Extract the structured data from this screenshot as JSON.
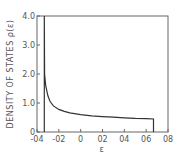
{
  "chart_data": {
    "type": "line",
    "title": "",
    "xlabel": "ε",
    "ylabel": "DENSITY OF STATES ρ(ε)",
    "xlim": [
      -0.4,
      0.8
    ],
    "ylim": [
      0,
      4.0
    ],
    "xticks": [
      "-0.4",
      "-0.2",
      "0",
      "0.2",
      "0.4",
      "0.6",
      "0.8"
    ],
    "xtick_labels": [
      "-04",
      "-02",
      "0",
      "02",
      "04",
      "06",
      "08"
    ],
    "yticks": [
      "0",
      "1.0",
      "2.0",
      "3.0",
      "4.0"
    ],
    "grid": false,
    "legend": null,
    "series": [
      {
        "name": "ρ(ε)",
        "x": [
          -0.333,
          -0.333,
          -0.33,
          -0.32,
          -0.3,
          -0.28,
          -0.25,
          -0.2,
          -0.15,
          -0.1,
          0.0,
          0.1,
          0.2,
          0.3,
          0.4,
          0.5,
          0.6,
          0.667,
          0.667
        ],
        "y": [
          0,
          4.0,
          2.0,
          1.6,
          1.25,
          1.05,
          0.9,
          0.78,
          0.71,
          0.66,
          0.6,
          0.56,
          0.53,
          0.51,
          0.49,
          0.47,
          0.46,
          0.45,
          0
        ]
      }
    ]
  }
}
